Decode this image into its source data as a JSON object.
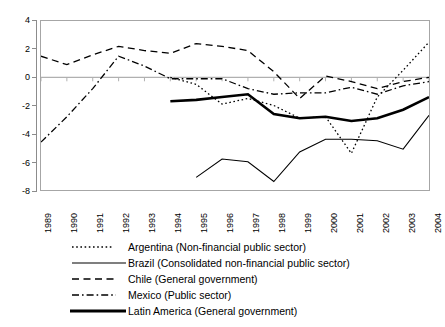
{
  "chart_data": {
    "type": "line",
    "title": "",
    "xlabel": "",
    "ylabel": "",
    "xlim": [
      1989,
      2004
    ],
    "ylim": [
      -8,
      4
    ],
    "yticks": [
      4,
      2,
      0,
      -2,
      -4,
      -6,
      -8
    ],
    "grid": false,
    "zero_line": true,
    "legend_position": "bottom",
    "categories": [
      1989,
      1990,
      1991,
      1992,
      1993,
      1994,
      1995,
      1996,
      1997,
      1998,
      1999,
      2000,
      2001,
      2002,
      2003,
      2004
    ],
    "series": [
      {
        "name": "Argentina (Non-financial public sector)",
        "style": "dotted",
        "width": 1.3,
        "color": "#000000",
        "x": [
          1994,
          1995,
          1996,
          1997,
          1998,
          1999,
          2000,
          2001,
          2002,
          2003,
          2004
        ],
        "values": [
          0.0,
          -0.5,
          -1.9,
          -1.5,
          -2.0,
          -2.9,
          -2.8,
          -5.4,
          -1.4,
          0.5,
          2.5
        ]
      },
      {
        "name": "Brazil (Consolidated non-financial public sector)",
        "style": "solid",
        "width": 1.1,
        "color": "#000000",
        "x": [
          1995,
          1996,
          1997,
          1998,
          1999,
          2000,
          2001,
          2002,
          2003,
          2004
        ],
        "values": [
          -7.1,
          -5.8,
          -6.0,
          -7.4,
          -5.3,
          -4.4,
          -4.4,
          -4.5,
          -5.1,
          -2.7
        ]
      },
      {
        "name": "Chile (General government)",
        "style": "dashed",
        "width": 1.3,
        "color": "#000000",
        "x": [
          1989,
          1990,
          1991,
          1992,
          1993,
          1994,
          1995,
          1996,
          1997,
          1998,
          1999,
          2000,
          2001,
          2002,
          2003,
          2004
        ],
        "values": [
          1.5,
          0.9,
          1.6,
          2.2,
          1.9,
          1.7,
          2.4,
          2.2,
          1.9,
          0.4,
          -1.5,
          0.1,
          -0.3,
          -0.8,
          -0.3,
          0.0
        ]
      },
      {
        "name": "Mexico (Public sector)",
        "style": "dashdot",
        "width": 1.3,
        "color": "#000000",
        "x": [
          1989,
          1990,
          1991,
          1992,
          1993,
          1994,
          1995,
          1996,
          1997,
          1998,
          1999,
          2000,
          2001,
          2002,
          2003,
          2004
        ],
        "values": [
          -4.6,
          -2.8,
          -0.8,
          1.5,
          0.8,
          -0.1,
          -0.1,
          -0.1,
          -0.8,
          -1.2,
          -1.1,
          -1.1,
          -0.7,
          -1.2,
          -0.6,
          -0.3
        ]
      },
      {
        "name": "Latin America (General government)",
        "style": "solid",
        "width": 2.6,
        "color": "#000000",
        "x": [
          1994,
          1995,
          1996,
          1997,
          1998,
          1999,
          2000,
          2001,
          2002,
          2003,
          2004
        ],
        "values": [
          -1.7,
          -1.6,
          -1.4,
          -1.2,
          -2.6,
          -2.9,
          -2.8,
          -3.1,
          -2.9,
          -2.3,
          -1.4
        ]
      }
    ]
  },
  "axis": {
    "y_tick_labels": [
      "4",
      "2",
      "0",
      "-2",
      "-4",
      "-6",
      "-8"
    ],
    "x_tick_labels": [
      "1989",
      "1990",
      "1991",
      "1992",
      "1993",
      "1994",
      "1995",
      "1996",
      "1997",
      "1998",
      "1999",
      "2000",
      "2001",
      "2002",
      "2003",
      "2004"
    ]
  },
  "legend": {
    "items": [
      {
        "label": "Argentina (Non-financial public sector)",
        "style": "dotted"
      },
      {
        "label": "Brazil (Consolidated non-financial public sector)",
        "style": "solid"
      },
      {
        "label": "Chile (General government)",
        "style": "dashed"
      },
      {
        "label": "Mexico (Public sector)",
        "style": "dashdot"
      },
      {
        "label": "Latin America (General government)",
        "style": "thick-solid"
      }
    ]
  },
  "colors": {
    "line": "#000000",
    "frame": "#a6a6a6",
    "zero_line": "#b0b0b0",
    "axis": "#8c8c8c",
    "background": "#ffffff"
  }
}
